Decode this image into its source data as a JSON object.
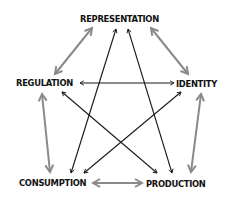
{
  "nodes": {
    "representation": {
      "label": "REPRESENTATION"
    },
    "regulation": {
      "label": "REGULATION"
    },
    "identity": {
      "label": "IDENTITY"
    },
    "consumption": {
      "label": "CONSUMPTION"
    },
    "production": {
      "label": "PRODUCTION"
    }
  },
  "edges": [
    {
      "from": "representation",
      "to": "regulation",
      "style": "gray",
      "bidirectional": true
    },
    {
      "from": "representation",
      "to": "identity",
      "style": "gray",
      "bidirectional": true
    },
    {
      "from": "regulation",
      "to": "consumption",
      "style": "gray",
      "bidirectional": true
    },
    {
      "from": "identity",
      "to": "production",
      "style": "gray",
      "bidirectional": true
    },
    {
      "from": "consumption",
      "to": "production",
      "style": "gray",
      "bidirectional": true
    },
    {
      "from": "regulation",
      "to": "identity",
      "style": "black",
      "bidirectional": true
    },
    {
      "from": "representation",
      "to": "consumption",
      "style": "black",
      "bidirectional": true
    },
    {
      "from": "representation",
      "to": "production",
      "style": "black",
      "bidirectional": true
    },
    {
      "from": "regulation",
      "to": "production",
      "style": "black",
      "bidirectional": true
    },
    {
      "from": "identity",
      "to": "consumption",
      "style": "black",
      "bidirectional": true
    }
  ],
  "colors": {
    "gray_arrow": "#8a8a8a",
    "black_arrow": "#1a1a1a",
    "text": "#111111",
    "background": "#ffffff"
  }
}
